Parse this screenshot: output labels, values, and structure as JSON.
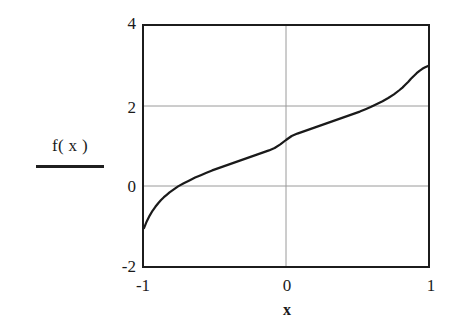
{
  "figure": {
    "background_color": "#ffffff",
    "frame_color": "#1c1c1c",
    "grid_color": "#9a9a9a",
    "curve_color": "#1a1a1a"
  },
  "axis": {
    "y_label_text": "f( x )",
    "y_ticks": [
      "4",
      "2",
      "0",
      "-2"
    ],
    "x_ticks": [
      "-1",
      "0",
      "1"
    ],
    "x_title": "x"
  },
  "chart_data": {
    "type": "line",
    "title": "",
    "subtitle": "",
    "xlabel": "x",
    "ylabel": "f( x )",
    "xlim": [
      -1,
      1
    ],
    "ylim": [
      -2,
      4
    ],
    "xticks": [
      -1,
      0,
      1
    ],
    "yticks": [
      -2,
      0,
      2,
      4
    ],
    "grid": true,
    "grid_lines": {
      "horizontal": [
        0,
        2
      ],
      "vertical": [
        0
      ]
    },
    "legend": {
      "shown": true,
      "position": "left-outside",
      "entries": [
        "f( x )"
      ]
    },
    "annotations": [],
    "series": [
      {
        "name": "f( x )",
        "color": "#1a1a1a",
        "line_width": 2.2,
        "style": "solid",
        "x": [
          -1.0,
          -0.98,
          -0.96,
          -0.94,
          -0.92,
          -0.9,
          -0.88,
          -0.86,
          -0.84,
          -0.82,
          -0.8,
          -0.76,
          -0.72,
          -0.68,
          -0.64,
          -0.6,
          -0.56,
          -0.52,
          -0.48,
          -0.44,
          -0.4,
          -0.36,
          -0.32,
          -0.28,
          -0.24,
          -0.2,
          -0.16,
          -0.12,
          -0.08,
          -0.04,
          0.0,
          0.04,
          0.08,
          0.12,
          0.16,
          0.2,
          0.24,
          0.28,
          0.32,
          0.36,
          0.4,
          0.44,
          0.48,
          0.52,
          0.56,
          0.6,
          0.64,
          0.68,
          0.72,
          0.76,
          0.8,
          0.82,
          0.84,
          0.86,
          0.88,
          0.9,
          0.92,
          0.94,
          0.96,
          0.98,
          1.0
        ],
        "y": [
          -1.05,
          -0.88,
          -0.74,
          -0.62,
          -0.52,
          -0.43,
          -0.35,
          -0.28,
          -0.22,
          -0.16,
          -0.11,
          -0.01,
          0.07,
          0.14,
          0.21,
          0.27,
          0.33,
          0.39,
          0.44,
          0.49,
          0.54,
          0.59,
          0.64,
          0.69,
          0.74,
          0.79,
          0.84,
          0.89,
          0.95,
          1.04,
          1.15,
          1.25,
          1.31,
          1.36,
          1.41,
          1.46,
          1.51,
          1.56,
          1.61,
          1.66,
          1.71,
          1.76,
          1.81,
          1.86,
          1.92,
          1.98,
          2.05,
          2.12,
          2.2,
          2.29,
          2.4,
          2.46,
          2.53,
          2.6,
          2.68,
          2.75,
          2.82,
          2.88,
          2.93,
          2.97,
          3.0
        ],
        "endpoints": {
          "start": [
            -1,
            -1.05
          ],
          "end": [
            1,
            3.0
          ]
        }
      }
    ]
  }
}
